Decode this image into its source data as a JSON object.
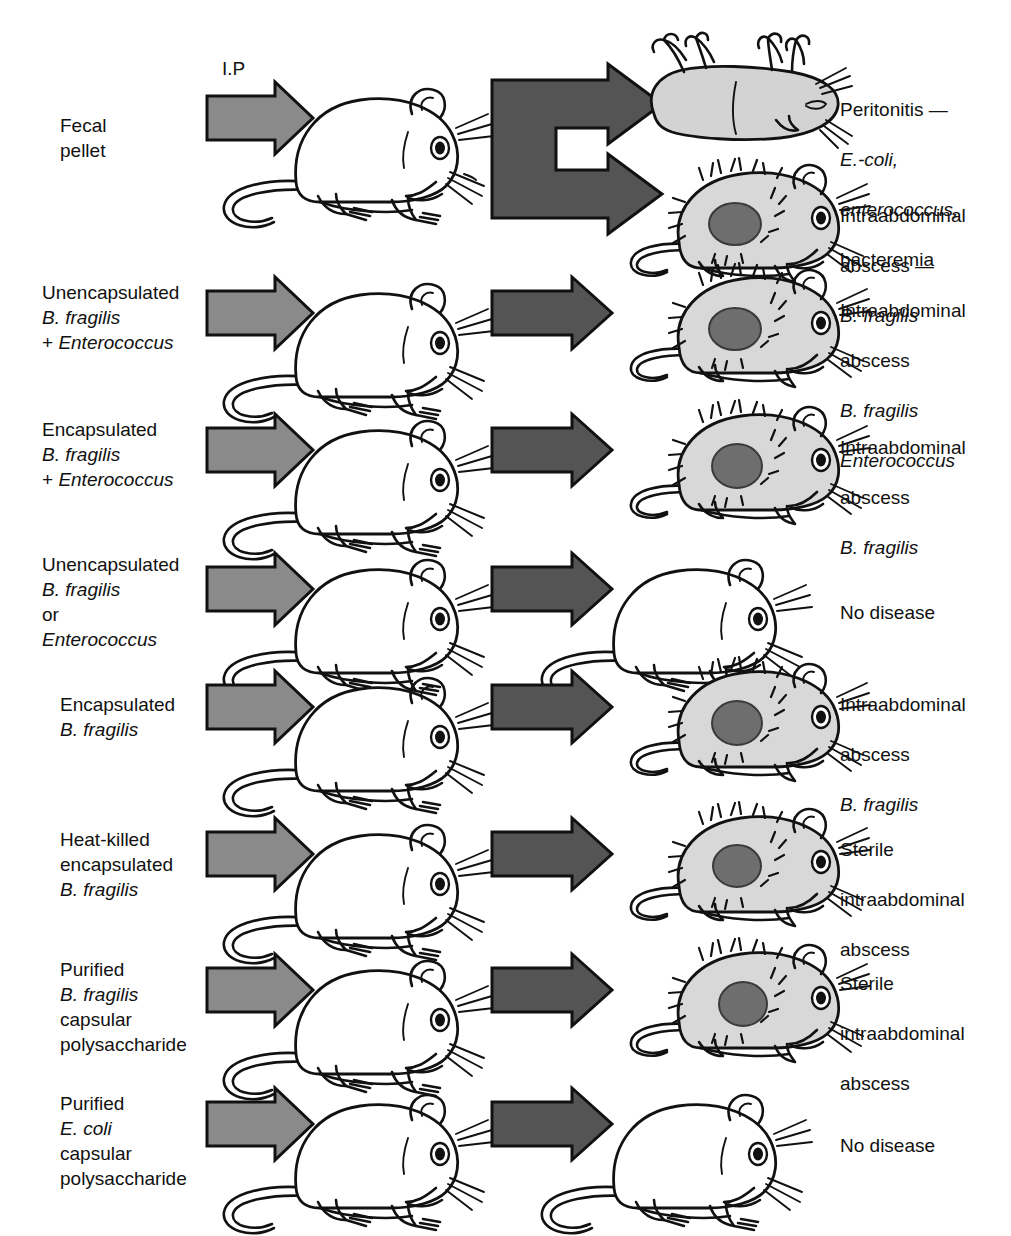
{
  "figure": {
    "title_present": false,
    "injection_route_label": "I.P",
    "arrow_color_left": "#8a8a8a",
    "arrow_color_right": "#545454",
    "abscess_color": "#6e6e6e",
    "background": "#ffffff"
  },
  "rows": [
    {
      "id": "row-fecal-pellet",
      "inoculum": "Fecal\npellet",
      "inoculum_plain": "Fecal pellet",
      "left_mouse": "healthy",
      "arrow_type": "branching",
      "outcomes": [
        {
          "mouse": "dead",
          "text_lines": [
            "Peritonitis —",
            "E.-coli,",
            "enterococcus,",
            "bacteremia"
          ],
          "italic_lines": [
            1,
            2
          ]
        },
        {
          "mouse": "abscess",
          "text_lines": [
            "Intraabdominal",
            "abscess —",
            "B. fragilis"
          ],
          "italic_lines": [
            2
          ]
        }
      ]
    },
    {
      "id": "row-unencapsulated-plus-entero",
      "inoculum": "Unencapsulated\nB. fragilis\n+ Enterococcus",
      "inoculum_plain": "Unencapsulated B. fragilis + Enterococcus",
      "left_mouse": "healthy",
      "arrow_type": "straight",
      "outcomes": [
        {
          "mouse": "abscess",
          "text_lines": [
            "Intraabdominal",
            "abscess",
            "B. fragilis",
            "Enterococcus"
          ],
          "italic_lines": [
            2,
            3
          ]
        }
      ]
    },
    {
      "id": "row-encapsulated-plus-entero",
      "inoculum": "Encapsulated\nB. fragilis\n+ Enterococcus",
      "inoculum_plain": "Encapsulated B. fragilis + Enterococcus",
      "left_mouse": "healthy",
      "arrow_type": "straight",
      "outcomes": [
        {
          "mouse": "abscess",
          "text_lines": [
            "Intraabdominal",
            "abscess",
            "B. fragilis"
          ],
          "italic_lines": [
            2
          ]
        }
      ]
    },
    {
      "id": "row-unencapsulated-or-entero",
      "inoculum": "Unencapsulated\nB. fragilis\nor\nEnterococcus",
      "inoculum_plain": "Unencapsulated B. fragilis or Enterococcus",
      "left_mouse": "healthy",
      "arrow_type": "straight",
      "outcomes": [
        {
          "mouse": "healthy",
          "text_lines": [
            "No disease"
          ],
          "italic_lines": []
        }
      ]
    },
    {
      "id": "row-encapsulated",
      "inoculum": "Encapsulated\nB. fragilis",
      "inoculum_plain": "Encapsulated B. fragilis",
      "left_mouse": "healthy",
      "arrow_type": "straight",
      "outcomes": [
        {
          "mouse": "abscess",
          "text_lines": [
            "Intraabdominal",
            "abscess",
            "B. fragilis"
          ],
          "italic_lines": [
            2
          ]
        }
      ]
    },
    {
      "id": "row-heat-killed",
      "inoculum": "Heat-killed\nencapsulated\nB. fragilis",
      "inoculum_plain": "Heat-killed encapsulated B. fragilis",
      "left_mouse": "healthy",
      "arrow_type": "straight",
      "outcomes": [
        {
          "mouse": "abscess",
          "text_lines": [
            "Sterile",
            "intraabdominal",
            "abscess"
          ],
          "italic_lines": []
        }
      ]
    },
    {
      "id": "row-purified-bf-polysaccharide",
      "inoculum": "Purified\nB. fragilis\ncapsular\npolysaccharide",
      "inoculum_plain": "Purified B. fragilis capsular polysaccharide",
      "left_mouse": "healthy",
      "arrow_type": "straight",
      "outcomes": [
        {
          "mouse": "abscess",
          "text_lines": [
            "Sterile",
            "intraabdominal",
            "abscess"
          ],
          "italic_lines": []
        }
      ]
    },
    {
      "id": "row-purified-ecoli-polysaccharide",
      "inoculum": "Purified\nE. coli\ncapsular\npolysaccharide",
      "inoculum_plain": "Purified E. coli capsular polysaccharide",
      "left_mouse": "healthy",
      "arrow_type": "straight",
      "outcomes": [
        {
          "mouse": "healthy",
          "text_lines": [
            "No disease"
          ],
          "italic_lines": []
        }
      ]
    }
  ]
}
